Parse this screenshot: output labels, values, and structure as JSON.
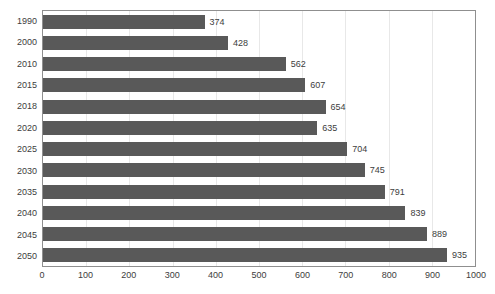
{
  "chart_data": {
    "type": "bar",
    "orientation": "horizontal",
    "title": "",
    "xlabel": "",
    "ylabel": "",
    "categories": [
      "1990",
      "2000",
      "2010",
      "2015",
      "2018",
      "2020",
      "2025",
      "2030",
      "2035",
      "2040",
      "2045",
      "2050"
    ],
    "values": [
      374,
      428,
      562,
      607,
      654,
      635,
      704,
      745,
      791,
      839,
      889,
      935
    ],
    "data_labels": [
      "374",
      "428",
      "562",
      "607",
      "654",
      "635",
      "704",
      "745",
      "791",
      "839",
      "889",
      "935"
    ],
    "xlim": [
      0,
      1000
    ],
    "xticks": [
      0,
      100,
      200,
      300,
      400,
      500,
      600,
      700,
      800,
      900,
      1000
    ],
    "xtick_labels": [
      "0",
      "100",
      "200",
      "300",
      "400",
      "500",
      "600",
      "700",
      "800",
      "900",
      "1000"
    ],
    "grid": "vertical",
    "legend": "none",
    "colors": {
      "bar": "#595959",
      "plot_border": "#8f8f8f",
      "gridline": "#e8e8e8",
      "text": "#3d3d3d",
      "background": "#ffffff"
    }
  }
}
